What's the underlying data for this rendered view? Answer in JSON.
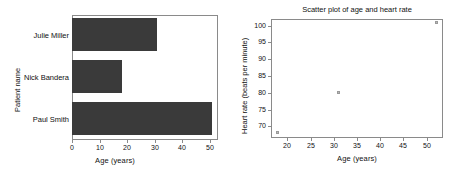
{
  "chart_data": [
    {
      "type": "bar",
      "orientation": "horizontal",
      "title": "",
      "categories": [
        "Julie Miller",
        "Nick Bandera",
        "Paul Smith"
      ],
      "values": [
        31,
        18,
        51
      ],
      "xlabel": "Age (years)",
      "ylabel": "Patient name",
      "xticks": [
        "0",
        "10",
        "20",
        "30",
        "40",
        "50"
      ],
      "xtick_values": [
        0,
        10,
        20,
        30,
        40,
        50
      ],
      "xlim": [
        0,
        53
      ],
      "grid": false,
      "legend": "none",
      "bar_color": "#3a3a3a"
    },
    {
      "type": "scatter",
      "title": "Scatter plot of age and heart rate",
      "xlabel": "Age (years)",
      "ylabel": "Heart rate (beats per minute)",
      "xticks": [
        "20",
        "25",
        "30",
        "35",
        "40",
        "45",
        "50"
      ],
      "xtick_values": [
        20,
        25,
        30,
        35,
        40,
        45,
        50
      ],
      "yticks": [
        "70",
        "75",
        "80",
        "85",
        "90",
        "95",
        "100"
      ],
      "ytick_values": [
        70,
        75,
        80,
        85,
        90,
        95,
        100
      ],
      "xlim": [
        16.5,
        53.5
      ],
      "ylim": [
        66.5,
        102
      ],
      "grid": false,
      "legend": "none",
      "point_color": "#b9b9b9",
      "points": [
        {
          "x": 18,
          "y": 68
        },
        {
          "x": 31,
          "y": 80
        },
        {
          "x": 52,
          "y": 101
        }
      ]
    }
  ]
}
